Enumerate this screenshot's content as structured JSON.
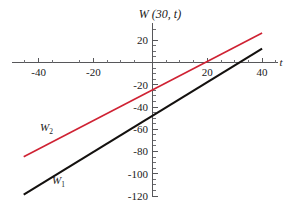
{
  "chart_data": {
    "type": "line",
    "title": "W (30, t)",
    "xlabel": "t",
    "ylabel": "",
    "xlim": [
      -48,
      42
    ],
    "ylim": [
      -124,
      32
    ],
    "grid": false,
    "legend": "inline-labels",
    "xticks": [
      -40,
      -20,
      20,
      40
    ],
    "xtick_labels": [
      "-40",
      "-20",
      "20",
      "40"
    ],
    "yticks": [
      20,
      -20,
      -40,
      -60,
      -80,
      -100,
      -120
    ],
    "ytick_labels": [
      "20",
      "-20",
      "-40",
      "-60",
      "-80",
      "-100",
      "-120"
    ],
    "x_minor_step": 5,
    "y_minor_step": 5,
    "series": [
      {
        "name": "W_1",
        "label_main": "W",
        "label_sub": "1",
        "color": "#14110f",
        "width": 2.1,
        "x": [
          -47,
          40
        ],
        "y": [
          -118.5,
          12.5
        ],
        "slope": 1.506,
        "intercept": -47.7,
        "x_intercept": 31.7
      },
      {
        "name": "W_2",
        "label_main": "W",
        "label_sub": "2",
        "color": "#cf2233",
        "width": 1.6,
        "x": [
          -47,
          40
        ],
        "y": [
          -84.5,
          26.5
        ],
        "slope": 1.276,
        "intercept": -24.5,
        "x_intercept": 19.2
      }
    ]
  },
  "axis": {
    "x_axis_name": "t",
    "y_axis_name": ""
  },
  "labels": {
    "w1_main": "W",
    "w1_sub": "1",
    "w2_main": "W",
    "w2_sub": "2"
  },
  "ticks": {
    "x": {
      "t_minus_40": "-40",
      "t_minus_20": "-20",
      "t_plus_20": "20",
      "t_plus_40": "40"
    },
    "y": {
      "v20": "20",
      "vm20": "-20",
      "vm40": "-40",
      "vm60": "-60",
      "vm80": "-80",
      "vm100": "-100",
      "vm120": "-120"
    }
  },
  "colors": {
    "w1": "#14110f",
    "w2": "#cf2233",
    "axis": "#57575a",
    "text": "#1a1a1a",
    "background": "#ffffff"
  }
}
